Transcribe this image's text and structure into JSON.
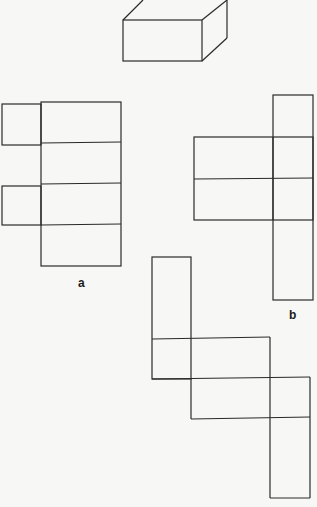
{
  "diagram": {
    "stroke_color": "#2a2a2a",
    "background": "#f7f7f5",
    "figures": [
      {
        "id": "box",
        "description": "3D rectangular box (cuboid) drawing"
      },
      {
        "id": "a",
        "label": "a",
        "description": "net of a box: column of 4 rectangles with 2 side flaps on left"
      },
      {
        "id": "b",
        "label": "b",
        "description": "net of a box: column of 5 rectangles with wide bar to the left spanning rows 2-3"
      },
      {
        "id": "c",
        "label": "",
        "description": "staircase-shaped net of rectangles"
      }
    ],
    "labels": {
      "a": "a",
      "b": "b"
    }
  }
}
